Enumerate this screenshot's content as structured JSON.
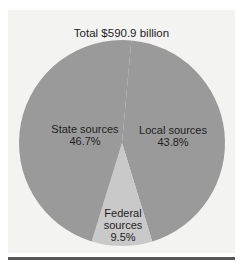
{
  "chart_data": {
    "type": "pie",
    "title": "Total $590.9 billion",
    "slices": [
      {
        "label": "Local sources",
        "value": 43.8,
        "display": "43.8%",
        "color": "#9a9a9a"
      },
      {
        "label": "Federal sources",
        "value": 9.5,
        "display": "9.5%",
        "color": "#c9c9c9"
      },
      {
        "label": "State sources",
        "value": 46.7,
        "display": "46.7%",
        "color": "#9a9a9a"
      }
    ],
    "legend": "none (labels inside slices)"
  },
  "labels": {
    "state_name": "State sources",
    "state_pct": "46.7%",
    "local_name": "Local sources",
    "local_pct": "43.8%",
    "federal_name1": "Federal",
    "federal_name2": "sources",
    "federal_pct": "9.5%"
  }
}
